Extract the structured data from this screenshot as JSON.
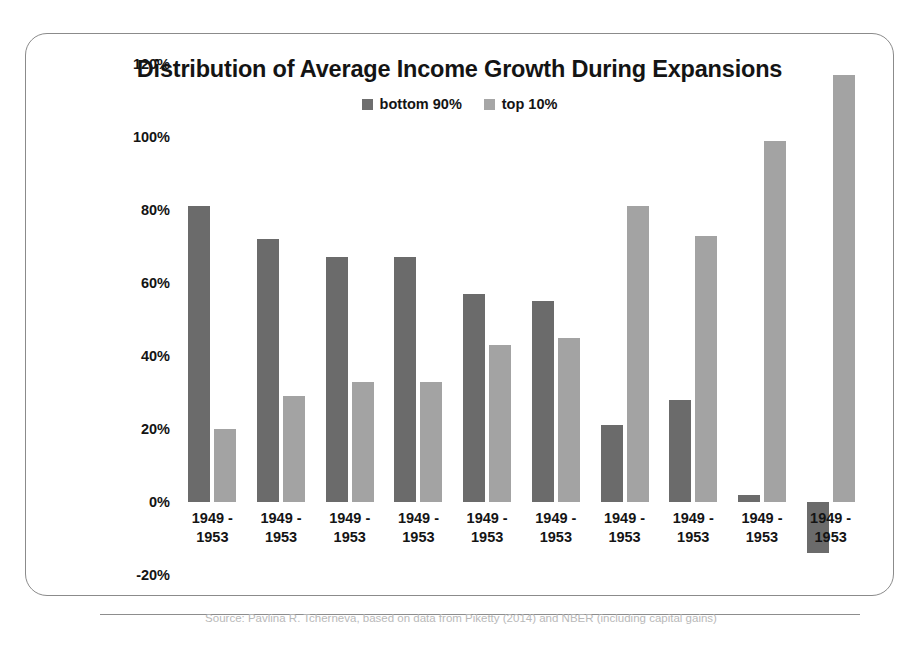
{
  "figure": {
    "caption": "Source: Pavlina R. Tcherneva, based on data from Piketty (2014) and NBER (including capital gains)"
  },
  "chart_data": {
    "type": "bar",
    "title": "Distribution of Average Income Growth During Expansions",
    "xlabel": "",
    "ylabel": "",
    "ylim": [
      -20,
      120
    ],
    "yticks": [
      120,
      100,
      80,
      60,
      40,
      20,
      0,
      -20
    ],
    "ytick_labels": [
      "120%",
      "100%",
      "80%",
      "60%",
      "40%",
      "20%",
      "0%",
      "-20%"
    ],
    "grid": false,
    "legend_position": "top-center",
    "categories": [
      "1949 - 1953",
      "1949 - 1953",
      "1949 - 1953",
      "1949 - 1953",
      "1949 - 1953",
      "1949 - 1953",
      "1949 - 1953",
      "1949 - 1953",
      "1949 - 1953",
      "1949 - 1953"
    ],
    "series": [
      {
        "name": "bottom 90%",
        "color": "#6b6b6b",
        "values": [
          81,
          72,
          67,
          67,
          57,
          55,
          21,
          28,
          2,
          -14
        ]
      },
      {
        "name": "top 10%",
        "color": "#a3a3a3",
        "values": [
          20,
          29,
          33,
          33,
          43,
          45,
          81,
          73,
          99,
          117
        ]
      }
    ]
  }
}
